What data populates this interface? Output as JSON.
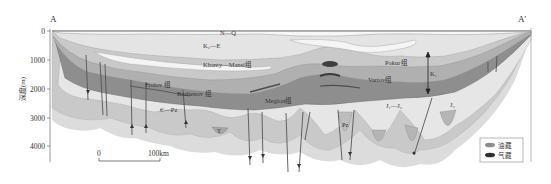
{
  "section": {
    "left_end": "A",
    "right_end": "A'"
  },
  "axis": {
    "ylabel": "深度(m)",
    "ticks": [
      "0",
      "1000",
      "2000",
      "3000",
      "4000"
    ]
  },
  "units": {
    "nq": "N—Q",
    "k2e": "K₂—E",
    "khanty": "Khanty—Mansi组",
    "pokur": "Pokur组",
    "frolov": "Frolov 组",
    "bazhenov": "Bazhenov 组",
    "vartov": "Vartov组",
    "megion": "Megion组",
    "paleozoic": "Є—Pz",
    "j1j2": "J₁—J₂",
    "pz": "Pz",
    "t": "T",
    "k1": "K₁",
    "j3": "J₃"
  },
  "scale_bar": {
    "start": "0",
    "end": "100km"
  },
  "legend": {
    "items": [
      {
        "label": "油藏",
        "color": "#8c8c8c"
      },
      {
        "label": "气藏",
        "color": "#2e2e2e"
      }
    ]
  },
  "colors": {
    "surface": "#f2f2f2",
    "upper": "#e3e3e3",
    "mid_light": "#cfcfcf",
    "mid": "#b2b2b2",
    "dark": "#8e8e8e",
    "darker": "#6f6f6f",
    "basement": "#d6d6d6",
    "outline": "#9a9a9a"
  }
}
